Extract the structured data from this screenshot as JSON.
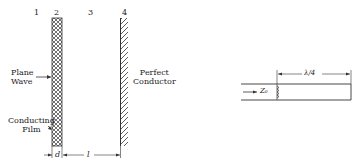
{
  "left_figure": {
    "region_labels": [
      "1",
      "2",
      "3",
      "4"
    ],
    "plane_wave": [
      "Plane",
      "Wave"
    ],
    "conducting_film": [
      "Conducting",
      "Film"
    ],
    "perfect_conductor": [
      "Perfect",
      "Conductor"
    ],
    "dim_d": "d",
    "dim_l": "l"
  },
  "right_figure": {
    "impedance_label": "Z₀",
    "length_label": "λ/4"
  }
}
